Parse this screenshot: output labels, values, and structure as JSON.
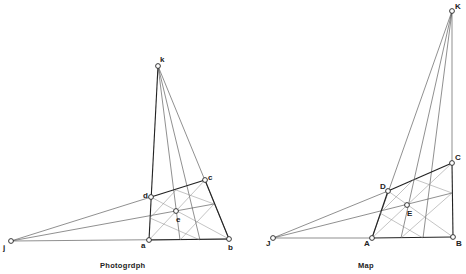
{
  "figures": [
    {
      "id": "photograph",
      "caption": "Photogrdph",
      "points": {
        "k": {
          "label": "k",
          "x": 158,
          "y": 66
        },
        "d": {
          "label": "d",
          "x": 151,
          "y": 197
        },
        "c": {
          "label": "c",
          "x": 205,
          "y": 180
        },
        "e": {
          "label": "e",
          "x": 176,
          "y": 211
        },
        "a": {
          "label": "a",
          "x": 149,
          "y": 240
        },
        "b": {
          "label": "b",
          "x": 229,
          "y": 239
        },
        "j": {
          "label": "j",
          "x": 11,
          "y": 241
        }
      }
    },
    {
      "id": "map",
      "caption": "Map",
      "points": {
        "K": {
          "label": "K",
          "x": 452,
          "y": 11
        },
        "C": {
          "label": "C",
          "x": 452,
          "y": 163
        },
        "D": {
          "label": "D",
          "x": 388,
          "y": 191
        },
        "E": {
          "label": "E",
          "x": 407,
          "y": 205
        },
        "A": {
          "label": "A",
          "x": 372,
          "y": 238
        },
        "B": {
          "label": "B",
          "x": 453,
          "y": 237
        },
        "J": {
          "label": "J",
          "x": 273,
          "y": 238
        }
      }
    }
  ]
}
